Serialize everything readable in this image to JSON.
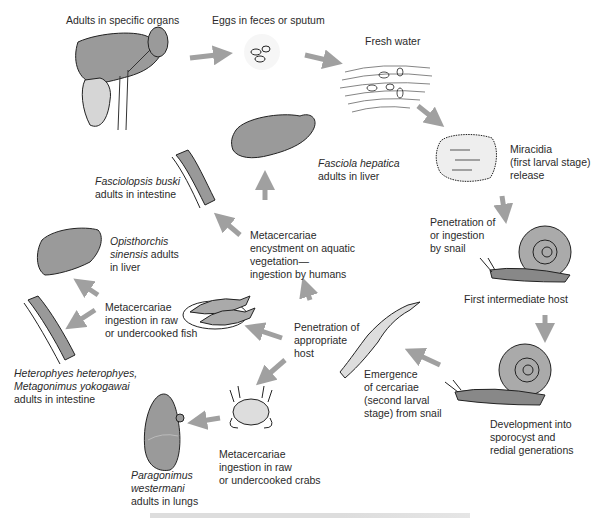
{
  "diagram": {
    "type": "life-cycle",
    "colors": {
      "organ_fill": "#9a9a9a",
      "arrow": "#a8a8a8",
      "outline": "#222222",
      "text": "#2a2a2a"
    },
    "stages": {
      "adults": "Adults in specific organs",
      "eggs": "Eggs in feces or sputum",
      "water": "Fresh water",
      "miracidia": [
        "Miracidia",
        "(first larval stage)",
        "release"
      ],
      "snail_penetration": [
        "Penetration of",
        "or ingestion",
        "by snail"
      ],
      "first_host": "First intermediate host",
      "development": [
        "Development into",
        "sporocyst and",
        "redial generations"
      ],
      "cercariae": [
        "Emergence",
        "of cercariae",
        "(second larval",
        "stage) from snail"
      ],
      "penetration_host": [
        "Penetration of",
        "appropriate",
        "host"
      ],
      "vegetation": [
        "Metacercariae",
        "encystment on aquatic",
        "vegetation—",
        "ingestion by humans"
      ],
      "fish": [
        "Metacercariae",
        "ingestion in raw",
        "or undercooked fish"
      ],
      "crabs": [
        "Metacercariae",
        "ingestion in raw",
        "or undercooked crabs"
      ]
    },
    "species": {
      "fasciola": {
        "name": "Fasciola hepatica",
        "site": "adults in liver"
      },
      "fasciolopsis": {
        "name": "Fasciolopsis buski",
        "site": "adults in intestine"
      },
      "opisthorchis": {
        "name_1": "Opisthorchis",
        "name_2": "sinensis",
        "site_1": " adults",
        "site_2": "in liver"
      },
      "heterophyes": {
        "name_1": "Heterophyes heterophyes,",
        "name_2": "Metagonimus yokogawai",
        "site": "adults in intestine"
      },
      "paragonimus": {
        "name_1": "Paragonimus",
        "name_2": "westermani",
        "site": "adults in lungs"
      }
    },
    "icons": [
      "liver-kidney-intestine-icon",
      "eggs-icon",
      "fresh-water-icon",
      "miracidium-icon",
      "snail-icon",
      "snail-icon",
      "cercaria-icon",
      "liver-icon",
      "intestine-icon",
      "liver-icon",
      "intestine-icon",
      "fish-plate-icon",
      "crab-icon",
      "lung-icon"
    ]
  }
}
